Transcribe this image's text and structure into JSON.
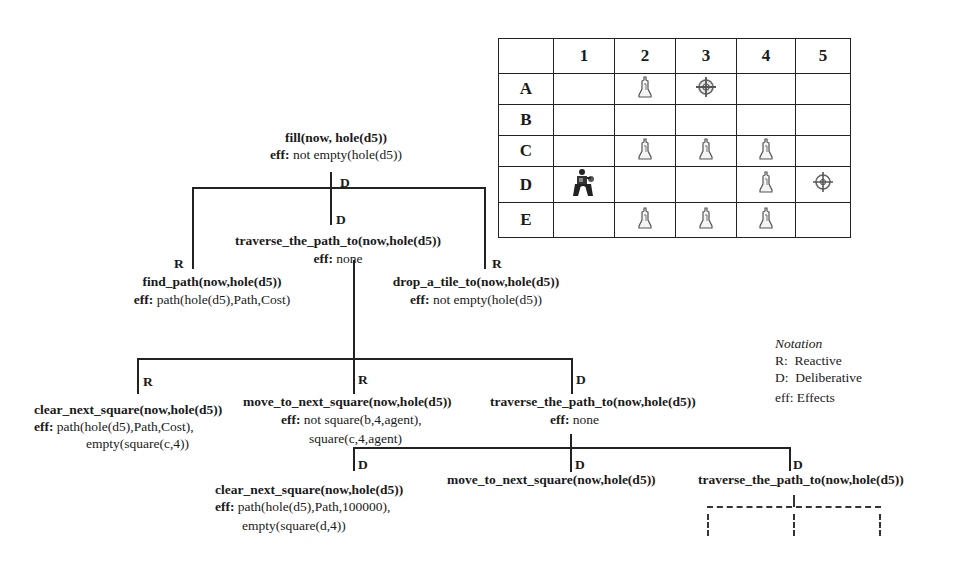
{
  "grid": {
    "columns": [
      "",
      "1",
      "2",
      "3",
      "4",
      "5"
    ],
    "rows": [
      {
        "label": "A",
        "cells": [
          "",
          "tile",
          "target",
          "",
          ""
        ]
      },
      {
        "label": "B",
        "cells": [
          "",
          "",
          "",
          "",
          ""
        ]
      },
      {
        "label": "C",
        "cells": [
          "",
          "tile",
          "tile",
          "tile",
          ""
        ]
      },
      {
        "label": "D",
        "cells": [
          "agent",
          "",
          "",
          "tile",
          "hole"
        ]
      },
      {
        "label": "E",
        "cells": [
          "",
          "tile",
          "tile",
          "tile",
          ""
        ]
      }
    ]
  },
  "tree": {
    "root": {
      "title": "fill(now, hole(d5))",
      "eff_label": "eff:",
      "eff": "not empty(hole(d5))"
    },
    "root_link_label": "D",
    "level1": {
      "find_path": {
        "link": "R",
        "title": "find_path(now,hole(d5))",
        "eff_label": "eff:",
        "eff": "path(hole(d5),Path,Cost)"
      },
      "traverse": {
        "link": "D",
        "title": "traverse_the_path_to(now,hole(d5))",
        "eff_label": "eff:",
        "eff": "none"
      },
      "drop": {
        "link": "R",
        "title": "drop_a_tile_to(now,hole(d5))",
        "eff_label": "eff:",
        "eff": "not empty(hole(d5))"
      }
    },
    "level2": {
      "clear": {
        "link": "R",
        "title": "clear_next_square(now,hole(d5))",
        "eff_label": "eff:",
        "eff": "path(hole(d5),Path,Cost),",
        "eff2": "empty(square(c,4))"
      },
      "move": {
        "link": "R",
        "title": "move_to_next_square(now,hole(d5))",
        "eff_label": "eff:",
        "eff": "not square(b,4,agent),",
        "eff2": "square(c,4,agent)"
      },
      "traverse": {
        "link": "D",
        "title": "traverse_the_path_to(now,hole(d5))",
        "eff_label": "eff:",
        "eff": "none"
      }
    },
    "level3": {
      "clear": {
        "link": "D",
        "title": "clear_next_square(now,hole(d5))",
        "eff_label": "eff:",
        "eff": "path(hole(d5),Path,100000),",
        "eff2": "empty(square(d,4))"
      },
      "move": {
        "link": "D",
        "title": "move_to_next_square(now,hole(d5))"
      },
      "traverse": {
        "link": "D",
        "title": "traverse_the_path_to(now,hole(d5))"
      }
    }
  },
  "notation": {
    "title": "Notation",
    "items": [
      "R:  Reactive",
      "D:  Deliberative",
      "eff: Effects"
    ]
  }
}
